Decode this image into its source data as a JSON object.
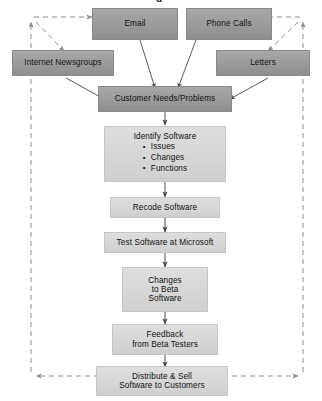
{
  "diagram": {
    "title_fragment": "g",
    "type": "flowchart",
    "colors": {
      "input_box_fill": "#9a9a9a",
      "process_box_fill": "#d6d6d6",
      "arrow_solid": "#4a4a4a",
      "arrow_dashed": "#8c8c8c",
      "text": "#111111",
      "background": "#ffffff"
    },
    "inputs": [
      {
        "id": "email",
        "label": "Email"
      },
      {
        "id": "phone-calls",
        "label": "Phone Calls"
      },
      {
        "id": "internet-newsgroups",
        "label": "Internet Newsgroups"
      },
      {
        "id": "letters",
        "label": "Letters"
      }
    ],
    "hub": {
      "id": "customer-needs",
      "label": "Customer Needs/Problems"
    },
    "process_steps": [
      {
        "id": "identify-software",
        "label": "Identify Software",
        "bullets": [
          "Issues",
          "Changes",
          "Functions"
        ]
      },
      {
        "id": "recode-software",
        "label": "Recode Software",
        "bullets": []
      },
      {
        "id": "test-software",
        "label": "Test Software at Microsoft",
        "bullets": []
      },
      {
        "id": "changes-beta",
        "label": "Changes\nto Beta\nSoftware",
        "lines": [
          "Changes",
          "to Beta",
          "Software"
        ],
        "bullets": []
      },
      {
        "id": "feedback-beta",
        "label": "Feedback\nfrom Beta Testers",
        "lines": [
          "Feedback",
          "from Beta Testers"
        ],
        "bullets": []
      },
      {
        "id": "distribute-sell",
        "label": "Distribute & Sell\nSoftware to Customers",
        "lines": [
          "Distribute & Sell",
          "Software to Customers"
        ],
        "bullets": []
      }
    ],
    "edges": [
      {
        "from": "email",
        "to": "customer-needs",
        "style": "solid"
      },
      {
        "from": "phone-calls",
        "to": "customer-needs",
        "style": "solid"
      },
      {
        "from": "internet-newsgroups",
        "to": "customer-needs",
        "style": "solid"
      },
      {
        "from": "letters",
        "to": "customer-needs",
        "style": "solid"
      },
      {
        "from": "customer-needs",
        "to": "identify-software",
        "style": "solid"
      },
      {
        "from": "identify-software",
        "to": "recode-software",
        "style": "solid"
      },
      {
        "from": "recode-software",
        "to": "test-software",
        "style": "solid"
      },
      {
        "from": "test-software",
        "to": "changes-beta",
        "style": "solid"
      },
      {
        "from": "changes-beta",
        "to": "feedback-beta",
        "style": "solid"
      },
      {
        "from": "feedback-beta",
        "to": "distribute-sell",
        "style": "solid"
      },
      {
        "from": "distribute-sell",
        "to": "left-return-path",
        "style": "dashed"
      },
      {
        "from": "distribute-sell",
        "to": "right-return-path",
        "style": "dashed"
      },
      {
        "from": "left-return-path",
        "to": "email",
        "style": "dashed"
      },
      {
        "from": "left-return-path",
        "to": "internet-newsgroups",
        "style": "dashed"
      },
      {
        "from": "right-return-path",
        "to": "phone-calls",
        "style": "dashed"
      },
      {
        "from": "right-return-path",
        "to": "letters",
        "style": "dashed"
      }
    ]
  }
}
